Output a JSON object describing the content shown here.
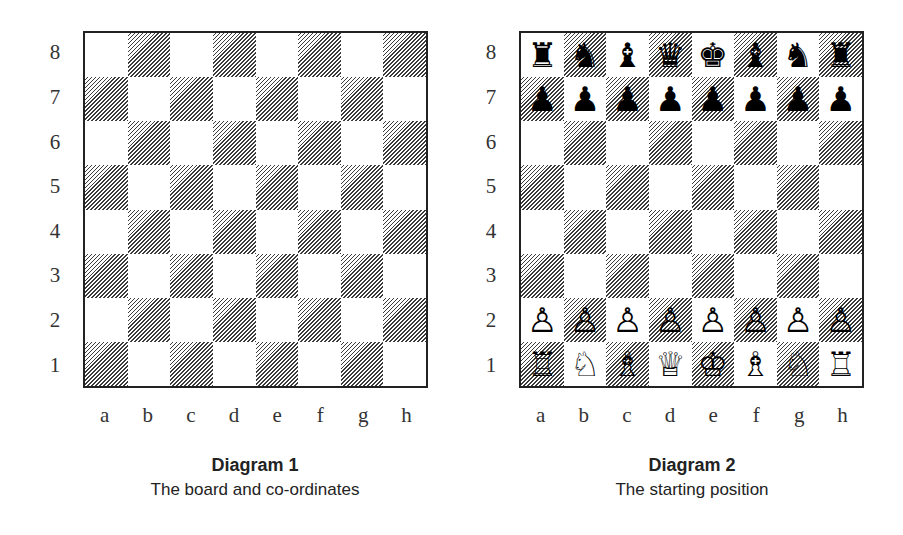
{
  "diagrams": [
    {
      "title": "Diagram 1",
      "subtitle": "The board and co-ordinates",
      "ranks": [
        "8",
        "7",
        "6",
        "5",
        "4",
        "3",
        "2",
        "1"
      ],
      "files": [
        "a",
        "b",
        "c",
        "d",
        "e",
        "f",
        "g",
        "h"
      ],
      "position": [
        [
          "",
          "",
          "",
          "",
          "",
          "",
          "",
          ""
        ],
        [
          "",
          "",
          "",
          "",
          "",
          "",
          "",
          ""
        ],
        [
          "",
          "",
          "",
          "",
          "",
          "",
          "",
          ""
        ],
        [
          "",
          "",
          "",
          "",
          "",
          "",
          "",
          ""
        ],
        [
          "",
          "",
          "",
          "",
          "",
          "",
          "",
          ""
        ],
        [
          "",
          "",
          "",
          "",
          "",
          "",
          "",
          ""
        ],
        [
          "",
          "",
          "",
          "",
          "",
          "",
          "",
          ""
        ],
        [
          "",
          "",
          "",
          "",
          "",
          "",
          "",
          ""
        ]
      ]
    },
    {
      "title": "Diagram 2",
      "subtitle": "The starting position",
      "ranks": [
        "8",
        "7",
        "6",
        "5",
        "4",
        "3",
        "2",
        "1"
      ],
      "files": [
        "a",
        "b",
        "c",
        "d",
        "e",
        "f",
        "g",
        "h"
      ],
      "position": [
        [
          "♜",
          "♞",
          "♝",
          "♛",
          "♚",
          "♝",
          "♞",
          "♜"
        ],
        [
          "♟",
          "♟",
          "♟",
          "♟",
          "♟",
          "♟",
          "♟",
          "♟"
        ],
        [
          "",
          "",
          "",
          "",
          "",
          "",
          "",
          ""
        ],
        [
          "",
          "",
          "",
          "",
          "",
          "",
          "",
          ""
        ],
        [
          "",
          "",
          "",
          "",
          "",
          "",
          "",
          ""
        ],
        [
          "",
          "",
          "",
          "",
          "",
          "",
          "",
          ""
        ],
        [
          "♙",
          "♙",
          "♙",
          "♙",
          "♙",
          "♙",
          "♙",
          "♙"
        ],
        [
          "♖",
          "♘",
          "♗",
          "♕",
          "♔",
          "♗",
          "♘",
          "♖"
        ]
      ],
      "piece_names": {
        "♜": "black-rook",
        "♞": "black-knight",
        "♝": "black-bishop",
        "♛": "black-queen",
        "♚": "black-king",
        "♟": "black-pawn",
        "♖": "white-rook",
        "♘": "white-knight",
        "♗": "white-bishop",
        "♕": "white-queen",
        "♔": "white-king",
        "♙": "white-pawn"
      }
    }
  ]
}
